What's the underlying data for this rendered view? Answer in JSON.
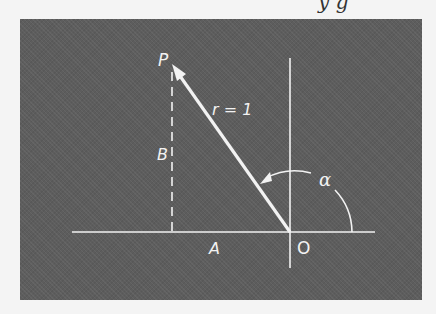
{
  "header": {
    "partial_text": "y g"
  },
  "diagram": {
    "background_color": "#5d5d5d",
    "line_color": "#f2f2f2",
    "labels": {
      "point_p": "P",
      "radius": "r = 1",
      "vertical_leg": "B",
      "horizontal_leg": "A",
      "origin": "O",
      "angle": "α"
    },
    "geometry": {
      "origin": [
        290,
        232
      ],
      "point_p": [
        172,
        65
      ],
      "horizontal_axis": [
        [
          72,
          232
        ],
        [
          375,
          232
        ]
      ],
      "vertical_axis": [
        [
          290,
          58
        ],
        [
          290,
          268
        ]
      ],
      "dashed_projection": [
        [
          172,
          65
        ],
        [
          172,
          232
        ]
      ],
      "angle_arc_radius": 62
    }
  }
}
